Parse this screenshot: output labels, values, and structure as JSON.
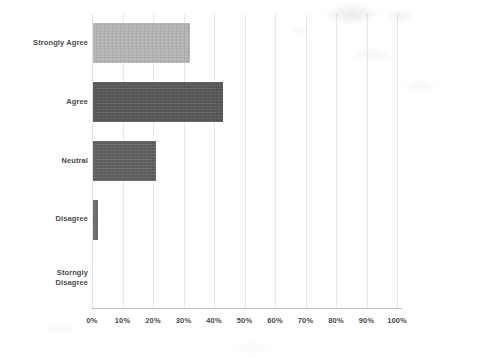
{
  "chart_data": {
    "type": "bar",
    "orientation": "horizontal",
    "title": "",
    "subtitle": "",
    "xlabel": "",
    "ylabel": "",
    "categories": [
      "Strongly Agree",
      "Agree",
      "Neutral",
      "Disagree",
      "Storngly Disagree"
    ],
    "values": [
      32,
      43,
      21,
      2,
      0
    ],
    "value_suffix": "%",
    "xlim": [
      0,
      100
    ],
    "xticks": [
      0,
      10,
      20,
      30,
      40,
      50,
      60,
      70,
      80,
      90,
      100
    ],
    "xticklabels": [
      "0%",
      "10%",
      "20%",
      "30%",
      "40%",
      "50%",
      "60%",
      "70%",
      "80%",
      "90%",
      "100%"
    ],
    "grid": true,
    "grid_axis": "x",
    "legend": false,
    "legend_position": "none",
    "annotations": [],
    "bar_colors": [
      "#b3b3b3",
      "#585858",
      "#606060",
      "#6a6a6a",
      "#6a6a6a"
    ],
    "series": [
      {
        "name": "Response share",
        "values": [
          32,
          43,
          21,
          2,
          0
        ]
      }
    ]
  },
  "style": {
    "background": "#ffffff",
    "grid_color": "#e9e9e9",
    "axis_color": "#bdbdbd",
    "text_color": "#4a4a4a"
  }
}
